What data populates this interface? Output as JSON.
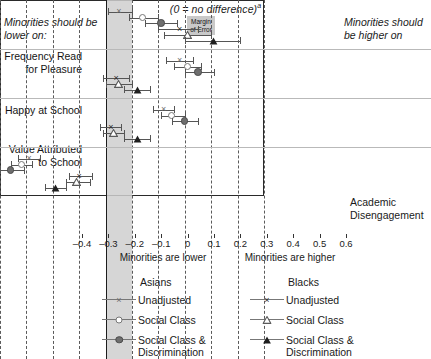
{
  "chart_data": {
    "type": "scatter",
    "title": "(0 = no difference)a",
    "title_main": "(0 = no difference)",
    "title_superscript": "a",
    "left_caption": "Minorities should be lower on:",
    "right_caption": "Minorities should be higher on",
    "moe_label_line1": "Margin",
    "moe_label_line2": "of Error",
    "moe_range": [
      0,
      0.1
    ],
    "xlabel_left": "Minorities are lower",
    "xlabel_right": "Minorities are higher",
    "xlim": [
      -0.4,
      0.6
    ],
    "xticks": [
      -0.4,
      -0.3,
      -0.2,
      -0.1,
      0,
      0.1,
      0.2,
      0.3,
      0.4,
      0.5,
      0.6
    ],
    "xticklabels": [
      "–0.4",
      "–0.3",
      "–0.2",
      "–0.1",
      "0",
      "0.1",
      "0.2",
      "0.3",
      "0.4",
      "0.5",
      "0.6"
    ],
    "grid": "vertical-dashed",
    "zero_reference": 0,
    "legend_position": "below",
    "categories": [
      "Frequency Read for Pleasure",
      "Happy at School",
      "Value Attributed to School",
      "Academic Disengagement"
    ],
    "category_labels": [
      {
        "line1": "Frequency Read",
        "line2": "for Pleasure"
      },
      {
        "line1": "Happy at School",
        "line2": ""
      },
      {
        "line1": "Value Attributed",
        "line2": "to School"
      },
      {
        "line1": "Academic",
        "line2": "Disengagement"
      }
    ],
    "series": [
      {
        "name": "Asians Unadjusted",
        "group": "Asians",
        "model": "Unadjusted",
        "marker": "x",
        "values": [
          0.05,
          0.28,
          0.22,
          -0.29
        ],
        "ci_low": [
          0.01,
          0.23,
          0.18,
          -0.33
        ],
        "ci_high": [
          0.1,
          0.33,
          0.26,
          -0.25
        ]
      },
      {
        "name": "Asians Social Class",
        "group": "Asians",
        "model": "Social Class",
        "marker": "open-circle",
        "values": [
          0.14,
          0.31,
          0.25,
          -0.32
        ],
        "ci_low": [
          0.09,
          0.26,
          0.21,
          -0.36
        ],
        "ci_high": [
          0.2,
          0.36,
          0.3,
          -0.28
        ]
      },
      {
        "name": "Asians Social Class & Discrimination",
        "group": "Asians",
        "model": "Social Class & Discrimination",
        "marker": "filled-circle",
        "values": [
          0.21,
          0.35,
          0.3,
          -0.36
        ],
        "ci_low": [
          0.15,
          0.3,
          0.25,
          -0.4
        ],
        "ci_high": [
          0.27,
          0.41,
          0.35,
          -0.31
        ]
      },
      {
        "name": "Blacks Unadjusted",
        "group": "Blacks",
        "model": "Unadjusted",
        "marker": "x-dark",
        "values": [
          0.28,
          0.04,
          0.02,
          -0.1
        ],
        "ci_low": [
          0.2,
          -0.01,
          -0.02,
          -0.14
        ],
        "ci_high": [
          0.35,
          0.09,
          0.06,
          -0.05
        ]
      },
      {
        "name": "Blacks Social Class",
        "group": "Blacks",
        "model": "Social Class",
        "marker": "open-triangle",
        "values": [
          0.31,
          0.05,
          0.03,
          -0.11
        ],
        "ci_low": [
          0.22,
          0.0,
          -0.01,
          -0.15
        ],
        "ci_high": [
          0.4,
          0.1,
          0.07,
          -0.06
        ]
      },
      {
        "name": "Blacks Social Class & Discrimination",
        "group": "Blacks",
        "model": "Social Class & Discrimination",
        "marker": "filled-triangle",
        "values": [
          0.41,
          0.12,
          0.12,
          -0.19
        ],
        "ci_low": [
          0.3,
          0.07,
          0.07,
          -0.23
        ],
        "ci_high": [
          0.51,
          0.17,
          0.17,
          -0.15
        ]
      }
    ]
  },
  "legend": {
    "asians": {
      "header": "Asians",
      "items": [
        {
          "label": "Unadjusted",
          "marker": "x"
        },
        {
          "label": "Social Class",
          "marker": "open-circle"
        },
        {
          "label": "Social Class &",
          "label2": "Discrimination",
          "marker": "filled-circle"
        }
      ]
    },
    "blacks": {
      "header": "Blacks",
      "items": [
        {
          "label": "Unadjusted",
          "marker": "x-dark"
        },
        {
          "label": "Social Class",
          "marker": "open-triangle"
        },
        {
          "label": "Social Class &",
          "label2": "Discrimination",
          "marker": "filled-triangle"
        }
      ]
    }
  }
}
